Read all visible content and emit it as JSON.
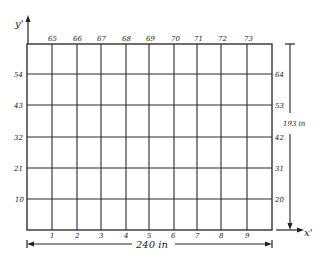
{
  "diagram": {
    "type": "grid-node-numbering",
    "axes": {
      "y_label": "y'",
      "x_label": "x'"
    },
    "dimensions": {
      "width_label": "240 in",
      "height_label": "193 in"
    },
    "top_labels": [
      "65",
      "66",
      "67",
      "68",
      "69",
      "70",
      "71",
      "72",
      "73"
    ],
    "bottom_labels": [
      "1",
      "2",
      "3",
      "4",
      "5",
      "6",
      "7",
      "8",
      "9"
    ],
    "left_labels": [
      "54",
      "43",
      "32",
      "21",
      "10"
    ],
    "right_labels": [
      "64",
      "53",
      "42",
      "31",
      "20"
    ],
    "colors": {
      "line": "#2a2a2a",
      "background": "#ffffff"
    }
  }
}
